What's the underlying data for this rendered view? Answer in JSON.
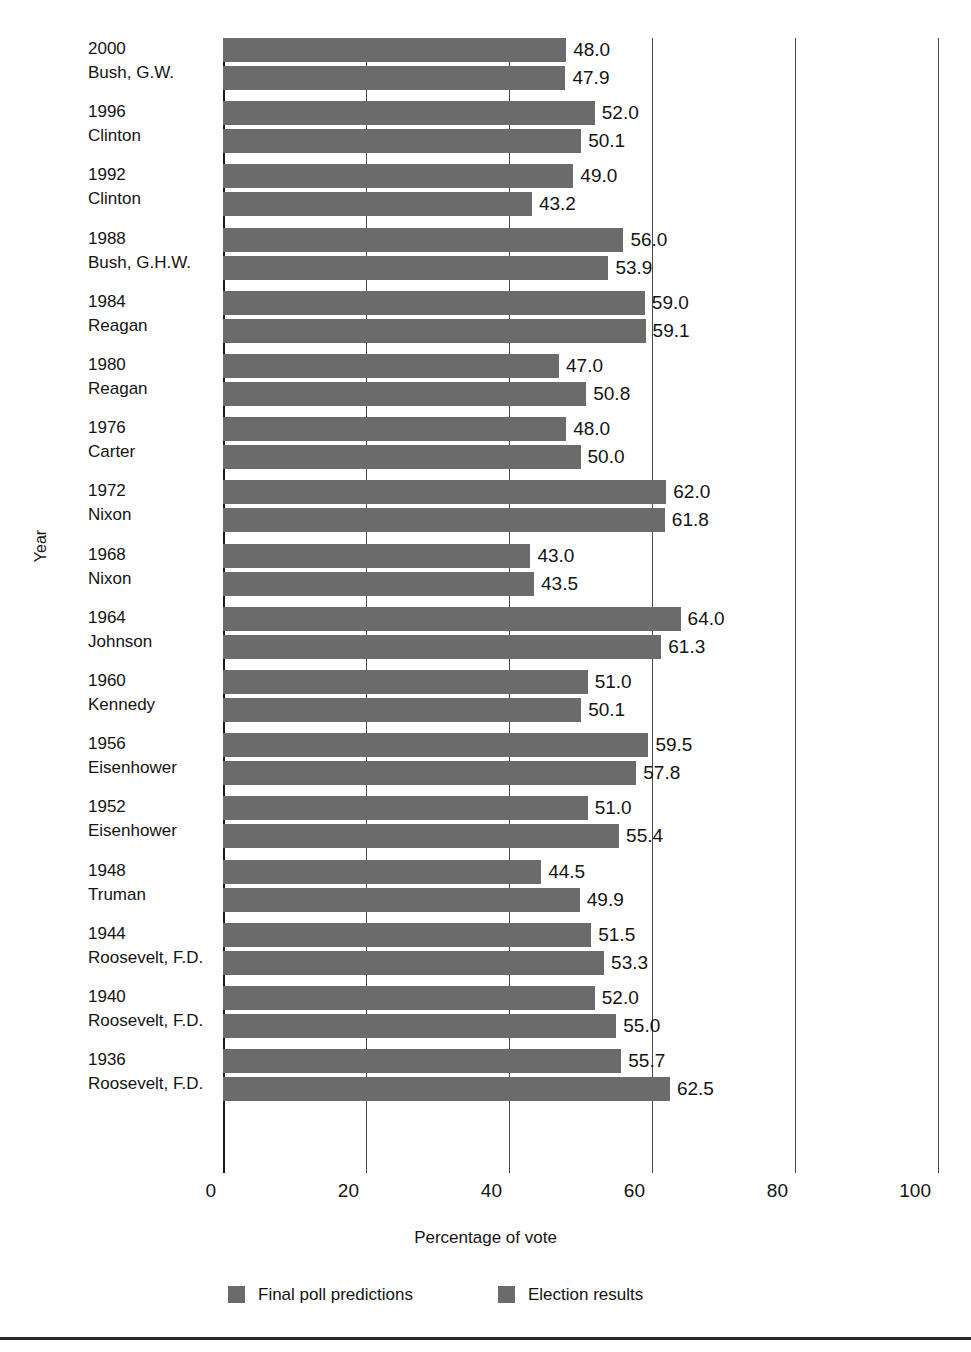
{
  "chart_data": {
    "type": "bar",
    "orientation": "horizontal",
    "title": "",
    "xlabel": "Percentage of vote",
    "ylabel": "Year",
    "xlim": [
      0,
      100
    ],
    "xticks": [
      "0",
      "20",
      "40",
      "60",
      "80",
      "100"
    ],
    "grid": true,
    "legend_position": "bottom",
    "bar_color": "#6b6b6b",
    "categories": [
      {
        "year": "2000",
        "person": "Bush, G.W."
      },
      {
        "year": "1996",
        "person": "Clinton"
      },
      {
        "year": "1992",
        "person": "Clinton"
      },
      {
        "year": "1988",
        "person": "Bush, G.H.W."
      },
      {
        "year": "1984",
        "person": "Reagan"
      },
      {
        "year": "1980",
        "person": "Reagan"
      },
      {
        "year": "1976",
        "person": "Carter"
      },
      {
        "year": "1972",
        "person": "Nixon"
      },
      {
        "year": "1968",
        "person": "Nixon"
      },
      {
        "year": "1964",
        "person": "Johnson"
      },
      {
        "year": "1960",
        "person": "Kennedy"
      },
      {
        "year": "1956",
        "person": "Eisenhower"
      },
      {
        "year": "1952",
        "person": "Eisenhower"
      },
      {
        "year": "1948",
        "person": "Truman"
      },
      {
        "year": "1944",
        "person": "Roosevelt, F.D."
      },
      {
        "year": "1940",
        "person": "Roosevelt, F.D."
      },
      {
        "year": "1936",
        "person": "Roosevelt, F.D."
      }
    ],
    "series": [
      {
        "name": "Final poll predictions",
        "values": [
          48.0,
          52.0,
          49.0,
          56.0,
          59.0,
          47.0,
          48.0,
          62.0,
          43.0,
          64.0,
          51.0,
          59.5,
          51.0,
          44.5,
          51.5,
          52.0,
          55.7
        ],
        "labels": [
          "48.0",
          "52.0",
          "49.0",
          "56.0",
          "59.0",
          "47.0",
          "48.0",
          "62.0",
          "43.0",
          "64.0",
          "51.0",
          "59.5",
          "51.0",
          "44.5",
          "51.5",
          "52.0",
          "55.7"
        ]
      },
      {
        "name": "Election results",
        "values": [
          47.9,
          50.1,
          43.2,
          53.9,
          59.1,
          50.8,
          50.0,
          61.8,
          43.5,
          61.3,
          50.1,
          57.8,
          55.4,
          49.9,
          53.3,
          55.0,
          62.5
        ],
        "labels": [
          "47.9",
          "50.1",
          "43.2",
          "53.9",
          "59.1",
          "50.8",
          "50.0",
          "61.8",
          "43.5",
          "61.3",
          "50.1",
          "57.8",
          "55.4",
          "49.9",
          "53.3",
          "55.0",
          "62.5"
        ]
      }
    ]
  }
}
